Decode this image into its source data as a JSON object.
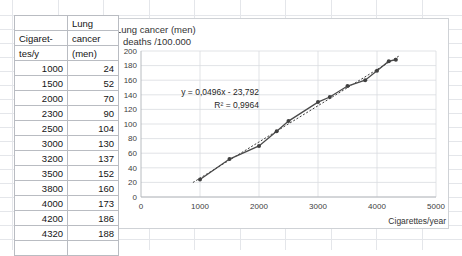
{
  "table": {
    "name": "cigarettes-lung-cancer-table",
    "headers": {
      "col1_line1": "",
      "col1_line2": "Cigaret-",
      "col1_line3": "tes/y",
      "col2_line1": "Lung",
      "col2_line2": "cancer",
      "col2_line3": "(men)"
    },
    "rows": [
      {
        "x": "1000",
        "y": "24"
      },
      {
        "x": "1500",
        "y": "52"
      },
      {
        "x": "2000",
        "y": "70"
      },
      {
        "x": "2300",
        "y": "90"
      },
      {
        "x": "2500",
        "y": "104"
      },
      {
        "x": "3000",
        "y": "130"
      },
      {
        "x": "3200",
        "y": "137"
      },
      {
        "x": "3500",
        "y": "152"
      },
      {
        "x": "3800",
        "y": "160"
      },
      {
        "x": "4000",
        "y": "173"
      },
      {
        "x": "4200",
        "y": "186"
      },
      {
        "x": "4320",
        "y": "188"
      }
    ]
  },
  "chart": {
    "title_line1": "Lung cancer (men)",
    "title_line2": "deaths /100.000",
    "equation": "y = 0,0496x - 23,792",
    "r_squared": "R² = 0,9964",
    "xaxis_title": "Cigarettes/year"
  },
  "chart_data": {
    "type": "scatter",
    "title": "Lung cancer (men) deaths /100.000",
    "xlabel": "Cigarettes/year",
    "ylabel": "Lung cancer (men) deaths /100.000",
    "xlim": [
      0,
      5000
    ],
    "ylim": [
      0,
      200
    ],
    "xticks": [
      0,
      1000,
      2000,
      3000,
      4000,
      5000
    ],
    "yticks": [
      0,
      20,
      40,
      60,
      80,
      100,
      120,
      140,
      160,
      180,
      200
    ],
    "grid": true,
    "legend": "none",
    "marker": "filled-circle",
    "line": "solid-connected",
    "x": [
      1000,
      1500,
      2000,
      2300,
      2500,
      3000,
      3200,
      3500,
      3800,
      4000,
      4200,
      4320
    ],
    "values": [
      24,
      52,
      70,
      90,
      104,
      130,
      137,
      152,
      160,
      173,
      186,
      188
    ],
    "series": [
      {
        "name": "Lung cancer (men) deaths /100.000",
        "x": [
          1000,
          1500,
          2000,
          2300,
          2500,
          3000,
          3200,
          3500,
          3800,
          4000,
          4200,
          4320
        ],
        "values": [
          24,
          52,
          70,
          90,
          104,
          130,
          137,
          152,
          160,
          173,
          186,
          188
        ]
      }
    ],
    "trendline": {
      "type": "linear",
      "style": "dotted",
      "slope": 0.0496,
      "intercept": -23.792,
      "equation": "y = 0,0496x - 23,792",
      "r_squared": 0.9964,
      "r_squared_label": "R² = 0,9964"
    },
    "annotations": [
      {
        "text": "y = 0,0496x - 23,792",
        "x": 2000,
        "y": 140
      },
      {
        "text": "R² = 0,9964",
        "x": 2000,
        "y": 122
      }
    ]
  },
  "colors": {
    "series": "#404040",
    "trendline": "#3c3c3c",
    "grid": "#d9dce0",
    "sheet_grid": "#e4e6ea",
    "table_border": "#b9bcc2"
  }
}
